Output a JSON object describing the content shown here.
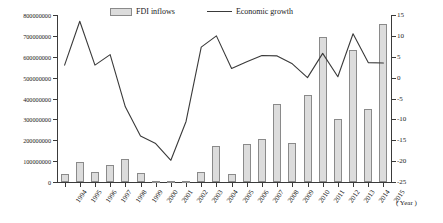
{
  "legend": {
    "bar_label": "FDI inflows",
    "line_label": "Economic growth"
  },
  "axes": {
    "x_caption": "( Year )",
    "left_ticks": [
      "0",
      "100000000",
      "200000000",
      "300000000",
      "400000000",
      "500000000",
      "600000000",
      "700000000",
      "800000000"
    ],
    "right_ticks": [
      "-25",
      "-20",
      "-15",
      "-10",
      "-5",
      "0",
      "5",
      "10",
      "15"
    ]
  },
  "colors": {
    "bar_fill": "#dcdcdc",
    "bar_stroke": "#8a8a8a",
    "line": "#3a3a3a",
    "axis": "#3a3a3a",
    "background": "#ffffff"
  },
  "chart_data": {
    "type": "bar",
    "title": "",
    "xlabel": "( Year )",
    "ylabel": "",
    "grid": false,
    "legend_position": "top",
    "categories": [
      "1994",
      "1995",
      "1996",
      "1997",
      "1998",
      "1999",
      "2000",
      "2001",
      "2002",
      "2003",
      "2004",
      "2005",
      "2006",
      "2007",
      "2008",
      "2009",
      "2010",
      "2011",
      "2012",
      "2013",
      "2014",
      "2015"
    ],
    "ylim": [
      0,
      800000000
    ],
    "y2lim": [
      -25,
      15
    ],
    "series": [
      {
        "name": "FDI inflows",
        "type": "bar",
        "axis": "left",
        "values": [
          38000000,
          97000000,
          47000000,
          83000000,
          111000000,
          41000000,
          3000000,
          4000000,
          5000000,
          46000000,
          173000000,
          40000000,
          181000000,
          205000000,
          374000000,
          187000000,
          415000000,
          696000000,
          303000000,
          631000000,
          348000000,
          757000000
        ]
      },
      {
        "name": "Economic growth",
        "type": "line",
        "axis": "right",
        "values": [
          3.0,
          13.5,
          3.0,
          5.5,
          -7.0,
          -14.0,
          -15.8,
          -19.8,
          -10.5,
          7.3,
          10.0,
          2.2,
          3.8,
          5.3,
          5.2,
          3.3,
          0.0,
          5.8,
          0.2,
          10.5,
          3.6,
          3.5
        ]
      }
    ]
  }
}
